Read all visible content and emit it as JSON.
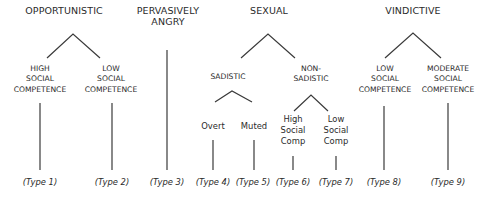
{
  "diagram": {
    "categories": [
      {
        "label": "OPPORTUNISTIC",
        "x": 64,
        "y": 14
      },
      {
        "label": "PERVASIVELY\nANGRY",
        "x": 168,
        "y": 14
      },
      {
        "label": "SEXUAL",
        "x": 269,
        "y": 14
      },
      {
        "label": "VINDICTIVE",
        "x": 413,
        "y": 14
      }
    ],
    "subcategories": [
      {
        "label": "HIGH\nSOCIAL\nCOMPETENCE",
        "x": 40,
        "y": 68
      },
      {
        "label": "LOW\nSOCIAL\nCOMPETENCE",
        "x": 111,
        "y": 68
      },
      {
        "label": "SADISTIC",
        "x": 228,
        "y": 74
      },
      {
        "label": "NON-\nSADISTIC",
        "x": 311,
        "y": 67
      },
      {
        "label": "LOW\nSOCIAL\nCOMPETENCE",
        "x": 385,
        "y": 68
      },
      {
        "label": "MODERATE\nSOCIAL\nCOMPETENCE",
        "x": 448,
        "y": 68
      }
    ],
    "leaves": [
      {
        "label": "Overt",
        "x": 213,
        "y": 124
      },
      {
        "label": "Muted",
        "x": 254,
        "y": 124
      },
      {
        "label": "High\nSocial\nComp",
        "x": 293,
        "y": 118
      },
      {
        "label": "Low\nSocial\nComp",
        "x": 336,
        "y": 118
      }
    ],
    "types": [
      {
        "label": "(Type 1)",
        "x": 40
      },
      {
        "label": "(Type 2)",
        "x": 112
      },
      {
        "label": "(Type 3)",
        "x": 167
      },
      {
        "label": "(Type 4)",
        "x": 213
      },
      {
        "label": "(Type 5)",
        "x": 253
      },
      {
        "label": "(Type 6)",
        "x": 293
      },
      {
        "label": "(Type 7)",
        "x": 336
      },
      {
        "label": "(Type 8)",
        "x": 384
      },
      {
        "label": "(Type 9)",
        "x": 448
      }
    ],
    "line_color": "#3a3a3a"
  }
}
